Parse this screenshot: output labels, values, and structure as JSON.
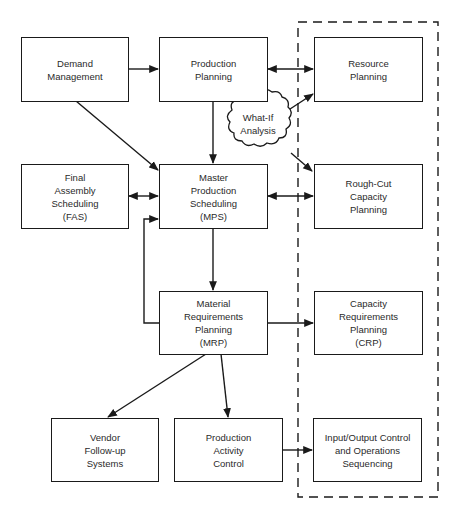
{
  "diagram": {
    "type": "flowchart",
    "colors": {
      "stroke": "#1a1a1a",
      "text": "#2a2a2a",
      "background": "#ffffff"
    },
    "nodes": {
      "demand_management": {
        "lines": [
          "Demand",
          "Management"
        ]
      },
      "production_planning": {
        "lines": [
          "Production",
          "Planning"
        ]
      },
      "resource_planning": {
        "lines": [
          "Resource",
          "Planning"
        ]
      },
      "fas": {
        "lines": [
          "Final",
          "Assembly",
          "Scheduling",
          "(FAS)"
        ]
      },
      "mps": {
        "lines": [
          "Master",
          "Production",
          "Scheduling",
          "(MPS)"
        ]
      },
      "rough_cut": {
        "lines": [
          "Rough-Cut",
          "Capacity",
          "Planning"
        ]
      },
      "mrp": {
        "lines": [
          "Material",
          "Requirements",
          "Planning",
          "(MRP)"
        ]
      },
      "crp": {
        "lines": [
          "Capacity",
          "Requirements",
          "Planning",
          "(CRP)"
        ]
      },
      "vendor": {
        "lines": [
          "Vendor",
          "Follow-up",
          "Systems"
        ]
      },
      "pac": {
        "lines": [
          "Production",
          "Activity",
          "Control"
        ]
      },
      "io_control": {
        "lines": [
          "Input/Output Control",
          "and Operations",
          "Sequencing"
        ]
      },
      "what_if": {
        "lines": [
          "What-If",
          "Analysis"
        ]
      }
    },
    "edges": [
      {
        "from": "Demand Management",
        "to": "Production Planning",
        "style": "arrow"
      },
      {
        "from": "Demand Management",
        "to": "Master Production Scheduling (MPS)",
        "style": "arrow"
      },
      {
        "from": "Production Planning",
        "to": "Resource Planning",
        "style": "bidirectional"
      },
      {
        "from": "Production Planning",
        "to": "Master Production Scheduling (MPS)",
        "style": "arrow"
      },
      {
        "from": "What-If Analysis",
        "to": "Resource Planning",
        "style": "arrow"
      },
      {
        "from": "What-If Analysis",
        "to": "Rough-Cut Capacity Planning",
        "style": "arrow"
      },
      {
        "from": "Final Assembly Scheduling (FAS)",
        "to": "Master Production Scheduling (MPS)",
        "style": "bidirectional"
      },
      {
        "from": "Master Production Scheduling (MPS)",
        "to": "Rough-Cut Capacity Planning",
        "style": "bidirectional"
      },
      {
        "from": "Master Production Scheduling (MPS)",
        "to": "Material Requirements Planning (MRP)",
        "style": "arrow"
      },
      {
        "from": "Material Requirements Planning (MRP)",
        "to": "Master Production Scheduling (MPS)",
        "style": "feedback-arrow"
      },
      {
        "from": "Material Requirements Planning (MRP)",
        "to": "Capacity Requirements Planning (CRP)",
        "style": "arrow"
      },
      {
        "from": "Material Requirements Planning (MRP)",
        "to": "Vendor Follow-up Systems",
        "style": "arrow"
      },
      {
        "from": "Material Requirements Planning (MRP)",
        "to": "Production Activity Control",
        "style": "arrow"
      },
      {
        "from": "Production Activity Control",
        "to": "Input/Output Control and Operations Sequencing",
        "style": "arrow"
      }
    ],
    "groups": [
      {
        "name": "capacity-planning-group",
        "style": "dashed",
        "members": [
          "Resource Planning",
          "Rough-Cut Capacity Planning",
          "Capacity Requirements Planning (CRP)",
          "Input/Output Control and Operations Sequencing"
        ]
      }
    ]
  }
}
